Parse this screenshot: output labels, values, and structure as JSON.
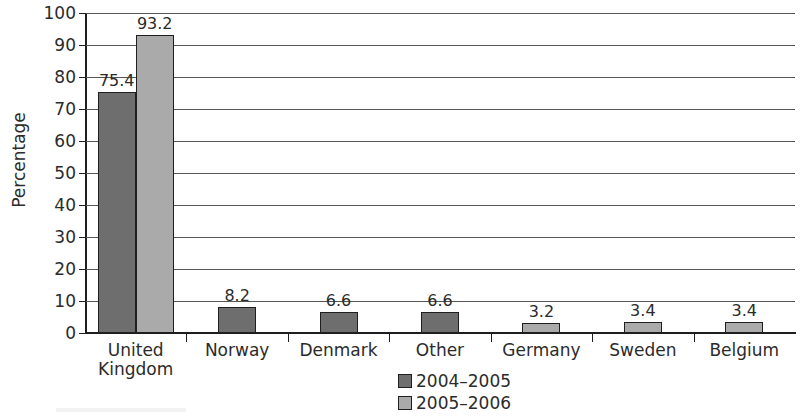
{
  "chart_data": {
    "type": "bar",
    "title": "",
    "xlabel": "",
    "ylabel": "Percentage",
    "ylim": [
      0,
      100
    ],
    "ytick_step": 10,
    "yticks": [
      0,
      10,
      20,
      30,
      40,
      50,
      60,
      70,
      80,
      90,
      100
    ],
    "grid": true,
    "legend_position": "bottom-center",
    "categories": [
      "United Kingdom",
      "Norway",
      "Denmark",
      "Other",
      "Germany",
      "Sweden",
      "Belgium"
    ],
    "category_labels": [
      [
        "United",
        "Kingdom"
      ],
      [
        "Norway"
      ],
      [
        "Denmark"
      ],
      [
        "Other"
      ],
      [
        "Germany"
      ],
      [
        "Sweden"
      ],
      [
        "Belgium"
      ]
    ],
    "series": [
      {
        "name": "2004–2005",
        "color": "#6e6e6e",
        "values": [
          75.4,
          8.2,
          6.6,
          6.6,
          null,
          null,
          null
        ]
      },
      {
        "name": "2005–2006",
        "color": "#aaaaaa",
        "values": [
          93.2,
          null,
          null,
          null,
          3.2,
          3.4,
          3.4
        ]
      }
    ],
    "value_labels": [
      [
        "75.4",
        "8.2",
        "6.6",
        "6.6",
        "",
        "",
        ""
      ],
      [
        "93.2",
        "",
        "",
        "",
        "3.2",
        "3.4",
        "3.4"
      ]
    ]
  },
  "legend": {
    "items": [
      {
        "label": "2004–2005",
        "color": "#6e6e6e"
      },
      {
        "label": "2005–2006",
        "color": "#aaaaaa"
      }
    ]
  }
}
